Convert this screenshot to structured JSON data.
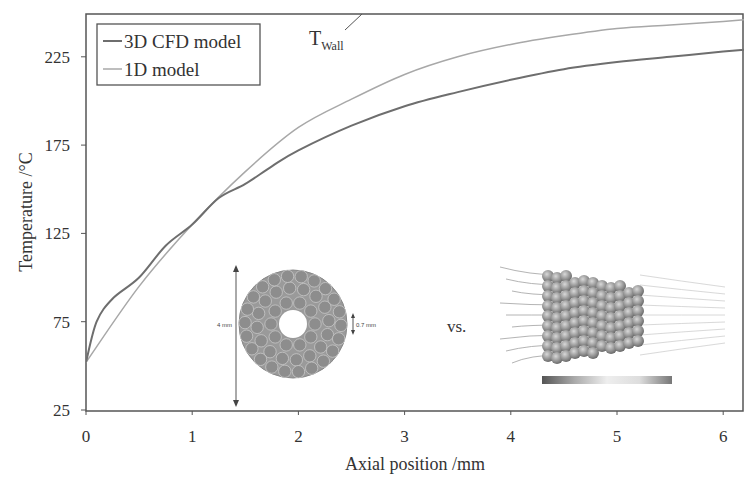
{
  "chart_data": {
    "type": "line",
    "title": "",
    "xlabel": "Axial position /mm",
    "ylabel": "Temperature /°C",
    "xlim": [
      0,
      6.2
    ],
    "ylim": [
      25,
      255
    ],
    "xticks": [
      0,
      1,
      2,
      3,
      4,
      5,
      6
    ],
    "yticks": [
      25,
      75,
      125,
      175,
      225
    ],
    "grid": false,
    "legend_position": "upper-left",
    "series": [
      {
        "name": "3D CFD model",
        "color": "#6e6e6e",
        "x": [
          0,
          0.1,
          0.25,
          0.5,
          0.75,
          1.0,
          1.25,
          1.5,
          1.75,
          2.0,
          2.5,
          3.0,
          3.5,
          4.0,
          4.5,
          5.0,
          5.5,
          6.0,
          6.2
        ],
        "values": [
          52,
          75,
          88,
          100,
          118,
          130,
          145,
          153,
          163,
          172,
          186,
          197,
          205,
          212,
          218,
          222,
          225,
          228,
          229
        ]
      },
      {
        "name": "1D model",
        "color": "#a8a8a8",
        "x": [
          0,
          0.5,
          1.0,
          1.5,
          2.0,
          2.5,
          3.0,
          3.5,
          4.0,
          4.5,
          5.0,
          5.5,
          6.0,
          6.2
        ],
        "values": [
          52,
          95,
          130,
          160,
          185,
          201,
          215,
          225,
          232,
          237,
          241,
          243,
          245,
          246
        ]
      }
    ],
    "annotations": [
      {
        "text": "T",
        "subscript": "Wall",
        "x_px": 310,
        "y_px": 44
      },
      {
        "text": "vs.",
        "x_px": 462,
        "y_px": 330
      },
      {
        "text": "4 mm",
        "x_px": 218,
        "y_px": 324
      },
      {
        "text": "0.7 mm",
        "x_px": 372,
        "y_px": 326
      }
    ],
    "insets": [
      {
        "description": "Cross-section of packed tube with particles, outer diameter 4 mm, inner hole 0.7 mm"
      },
      {
        "description": "3D CFD rendering of packed particle bed with temperature colorbar"
      }
    ]
  },
  "legend": {
    "items": [
      {
        "label": "3D CFD model",
        "color": "#6e6e6e"
      },
      {
        "label": "1D model",
        "color": "#a8a8a8"
      }
    ]
  },
  "axes": {
    "x_title": "Axial position /mm",
    "y_title": "Temperature /°C",
    "x_ticks": [
      "0",
      "1",
      "2",
      "3",
      "4",
      "5",
      "6"
    ],
    "y_ticks": [
      "25",
      "75",
      "125",
      "175",
      "225"
    ]
  },
  "annotation": {
    "twall_main": "T",
    "twall_sub": "Wall",
    "vs": "vs.",
    "outer_dim": "4 mm",
    "inner_dim": "0.7 mm"
  }
}
